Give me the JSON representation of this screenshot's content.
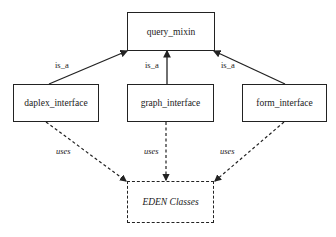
{
  "diagram": {
    "nodes": [
      {
        "id": "query_mixin",
        "label": "query_mixin",
        "style": "solid"
      },
      {
        "id": "daplex_interface",
        "label": "daplex_interface",
        "style": "solid"
      },
      {
        "id": "graph_interface",
        "label": "graph_interface",
        "style": "solid"
      },
      {
        "id": "form_interface",
        "label": "form_interface",
        "style": "solid"
      },
      {
        "id": "eden_classes",
        "label": "EDEN Classes",
        "style": "dashed"
      }
    ],
    "edges": [
      {
        "from": "daplex_interface",
        "to": "query_mixin",
        "label": "is_a",
        "style": "solid"
      },
      {
        "from": "graph_interface",
        "to": "query_mixin",
        "label": "is_a",
        "style": "solid"
      },
      {
        "from": "form_interface",
        "to": "query_mixin",
        "label": "is_a",
        "style": "solid"
      },
      {
        "from": "daplex_interface",
        "to": "eden_classes",
        "label": "uses",
        "style": "dashed"
      },
      {
        "from": "graph_interface",
        "to": "eden_classes",
        "label": "uses",
        "style": "dashed"
      },
      {
        "from": "form_interface",
        "to": "eden_classes",
        "label": "uses",
        "style": "dashed"
      }
    ]
  }
}
